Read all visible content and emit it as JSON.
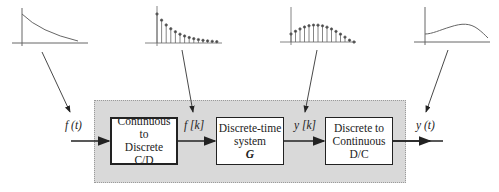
{
  "blocks": [
    {
      "id": "cd",
      "lines": [
        "Continuous to",
        "Discrete",
        "C/D"
      ]
    },
    {
      "id": "g",
      "lines": [
        "Discrete-time",
        "system"
      ],
      "symbol": "G"
    },
    {
      "id": "dc",
      "lines": [
        "Discrete to",
        "Continuous",
        "D/C"
      ]
    }
  ],
  "signals": {
    "input": "f (t)",
    "sampled": "f [k]",
    "output_discrete": "y [k]",
    "output": "y (t)"
  },
  "plots": [
    {
      "signal": "f(t)",
      "kind": "continuous",
      "shape": "decaying exponential"
    },
    {
      "signal": "f[k]",
      "kind": "discrete stem",
      "shape": "decaying exponential samples",
      "samples": 14
    },
    {
      "signal": "y[k]",
      "kind": "discrete stem",
      "shape": "rising then falling hump",
      "samples": 15
    },
    {
      "signal": "y(t)",
      "kind": "continuous",
      "shape": "rising then falling hump"
    }
  ],
  "colors": {
    "shade": "#d9d9d9",
    "line": "#222222",
    "plot": "#555555"
  }
}
